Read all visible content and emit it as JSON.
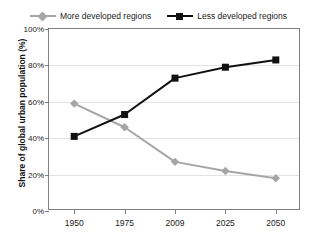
{
  "chart_data": {
    "type": "line",
    "title": "",
    "xlabel": "",
    "ylabel": "Share of global urban population (%)",
    "categories": [
      "1950",
      "1975",
      "2009",
      "2025",
      "2050"
    ],
    "ylim": [
      0,
      100
    ],
    "yticks": [
      0,
      20,
      40,
      60,
      80,
      100
    ],
    "ytick_labels": [
      "0%",
      "20%",
      "40%",
      "60%",
      "80%",
      "100%"
    ],
    "grid": true,
    "legend_position": "top",
    "series": [
      {
        "name": "More developed regions",
        "values": [
          59,
          46,
          27,
          22,
          18
        ],
        "color": "#a6a6a6",
        "marker": "diamond"
      },
      {
        "name": "Less developed regions",
        "values": [
          41,
          53,
          73,
          79,
          83
        ],
        "color": "#111111",
        "marker": "square"
      }
    ]
  },
  "legend": {
    "entries": [
      {
        "label": "More developed regions"
      },
      {
        "label": "Less developed regions"
      }
    ]
  }
}
